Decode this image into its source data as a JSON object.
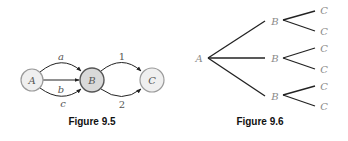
{
  "figure_95": {
    "caption": "Figure 9.5",
    "nodes": [
      {
        "id": "A",
        "label": "A",
        "cx": 32,
        "cy": 80,
        "r": 11,
        "fill": "#efefef",
        "stroke": "#9a9a9a"
      },
      {
        "id": "B",
        "label": "B",
        "cx": 92,
        "cy": 80,
        "r": 12,
        "fill": "#d9d9d9",
        "stroke": "#555555"
      },
      {
        "id": "C",
        "label": "C",
        "cx": 152,
        "cy": 80,
        "r": 12,
        "fill": "#efefef",
        "stroke": "#9a9a9a"
      }
    ],
    "edges": [
      {
        "from": "A",
        "to": "B",
        "label": "a"
      },
      {
        "from": "A",
        "to": "B",
        "label": "b"
      },
      {
        "from": "A",
        "to": "B",
        "label": "c"
      },
      {
        "from": "B",
        "to": "C",
        "label": "1"
      },
      {
        "from": "B",
        "to": "C",
        "label": "2"
      }
    ]
  },
  "figure_96": {
    "caption": "Figure 9.6",
    "root": "A",
    "level1": [
      "B",
      "B",
      "B"
    ],
    "level2": [
      "C",
      "C",
      "C",
      "C",
      "C",
      "C"
    ]
  }
}
